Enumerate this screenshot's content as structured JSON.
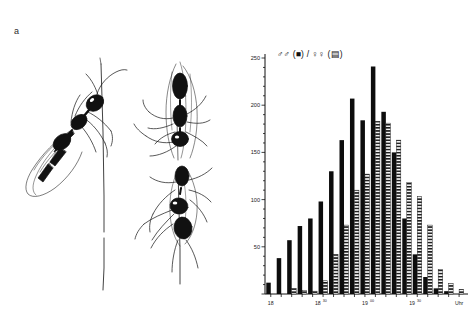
{
  "figure": {
    "panel_a_label": "a",
    "panel_b_label": "b"
  },
  "panel_a": {
    "description": "ink drawing of winged ant alates resting on grass stems",
    "subjects": [
      "winged-ant-left",
      "winged-ant-upper-right",
      "winged-ant-lower-right"
    ],
    "stems": [
      "grass-stem-center",
      "grass-stem-right"
    ]
  },
  "chart_data": {
    "type": "bar",
    "title": "",
    "subtitle": "",
    "xlabel": "Uhr",
    "ylabel": "",
    "legend": "♂♂ (■) / ♀♀ (▤)",
    "legend_entries": [
      {
        "name": "males",
        "symbol": "♂♂",
        "marker": "■",
        "fill": "solid-black"
      },
      {
        "name": "females",
        "symbol": "♀♀",
        "marker": "▤",
        "fill": "horizontal-hatch"
      }
    ],
    "legend_position": "top-left-inside",
    "grid": false,
    "ylim": [
      0,
      250
    ],
    "yticks": [
      0,
      50,
      100,
      150,
      200,
      250
    ],
    "ytick_labels": [
      "",
      "50",
      "100",
      "150",
      "200",
      "250"
    ],
    "categories": [
      "18:00",
      "18:10",
      "18:20",
      "18:30",
      "18:40",
      "18:50",
      "19:00",
      "19:10",
      "19:20",
      "19:30",
      "19:40",
      "19:50",
      "20:00",
      "20:10",
      "20:20",
      "20:30",
      "20:40",
      "20:50",
      "21:00"
    ],
    "xtick_positions": [
      0,
      4.5,
      9,
      13.5,
      18
    ],
    "xtick_labels": [
      {
        "base": "18",
        "sup": ""
      },
      {
        "base": "18",
        "sup": "30"
      },
      {
        "base": "19",
        "sup": "00"
      },
      {
        "base": "19",
        "sup": "30"
      },
      {
        "base": "Uhr",
        "sup": ""
      }
    ],
    "series": [
      {
        "name": "males",
        "symbol": "♂♂",
        "values": [
          12,
          38,
          57,
          72,
          80,
          98,
          130,
          163,
          207,
          184,
          241,
          193,
          150,
          80,
          42,
          18,
          6,
          3,
          0
        ]
      },
      {
        "name": "females",
        "symbol": "♀♀",
        "values": [
          0,
          0,
          6,
          4,
          3,
          14,
          42,
          73,
          110,
          127,
          183,
          181,
          163,
          118,
          103,
          73,
          26,
          11,
          5
        ]
      }
    ]
  }
}
